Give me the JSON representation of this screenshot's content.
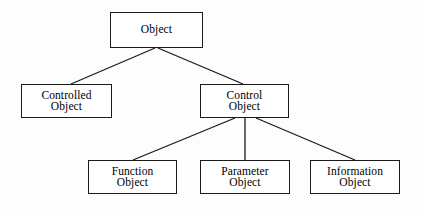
{
  "diagram": {
    "type": "hierarchy-tree",
    "background_color": "#fdfdfd",
    "line_color": "#1a1a1a",
    "text_color": "#000000",
    "nodes": [
      {
        "id": "object",
        "label": "Object",
        "lines": [
          "Object"
        ],
        "level": 0
      },
      {
        "id": "controlled-object",
        "label": "Controlled Object",
        "lines": [
          "Controlled",
          "Object"
        ],
        "level": 1
      },
      {
        "id": "control-object",
        "label": "Control Object",
        "lines": [
          "Control",
          "Object"
        ],
        "level": 1
      },
      {
        "id": "function-object",
        "label": "Function Object",
        "lines": [
          "Function",
          "Object"
        ],
        "level": 2
      },
      {
        "id": "parameter-object",
        "label": "Parameter Object",
        "lines": [
          "Parameter",
          "Object"
        ],
        "level": 2
      },
      {
        "id": "information-object",
        "label": "Information Object",
        "lines": [
          "Information",
          "Object"
        ],
        "level": 2
      }
    ],
    "edges": [
      {
        "from": "object",
        "to": "controlled-object"
      },
      {
        "from": "object",
        "to": "control-object"
      },
      {
        "from": "control-object",
        "to": "function-object"
      },
      {
        "from": "control-object",
        "to": "parameter-object"
      },
      {
        "from": "control-object",
        "to": "information-object"
      }
    ]
  }
}
